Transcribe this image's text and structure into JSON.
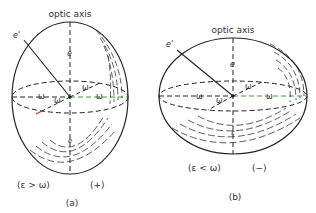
{
  "figure": {
    "panel_a": {
      "axis_label": "optic axis",
      "ray_label": "e'",
      "axis_symbol": "e",
      "lower_axis_symbol": "e",
      "omega_labels": [
        "ω",
        "ω",
        "ω",
        "ω"
      ],
      "condition": "(ε > ω)",
      "sign": "(+)",
      "caption": "(a)"
    },
    "panel_b": {
      "axis_label": "optic axis",
      "ray_label": "e'",
      "axis_symbol": "e",
      "lower_axis_symbol": "ε",
      "omega_labels": [
        "ω",
        "ω",
        "ω",
        "ω"
      ],
      "condition": "(ε < ω)",
      "sign": "(−)",
      "caption": "(b)"
    },
    "colors": {
      "line": "#222222",
      "accent_green": "#3a9a3a",
      "accent_red": "#c0392b"
    }
  }
}
